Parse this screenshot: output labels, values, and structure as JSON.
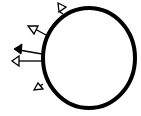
{
  "diagram": {
    "background": "#ffffff",
    "stroke": "#000000",
    "circle": {
      "cx": 89,
      "cy": 58,
      "rx": 46,
      "ry": 50,
      "stroke_width": 4
    },
    "arrows": [
      {
        "name": "arrow-top",
        "x1": 64,
        "y1": 12,
        "x2": 64,
        "y2": 12,
        "head": "open",
        "tip": [
          66,
          6
        ],
        "angle": -25
      },
      {
        "name": "arrow-upper-left",
        "x1": 45,
        "y1": 34,
        "x2": 34,
        "y2": 28,
        "head": "open"
      },
      {
        "name": "arrow-middle-filled",
        "x1": 41,
        "y1": 54,
        "x2": 20,
        "y2": 50,
        "head": "filled"
      },
      {
        "name": "arrow-middle-open",
        "x1": 41,
        "y1": 61,
        "x2": 18,
        "y2": 61,
        "head": "open"
      },
      {
        "name": "arrow-bottom-left",
        "x1": 42,
        "y1": 86,
        "x2": 42,
        "y2": 86,
        "head": "open"
      }
    ]
  }
}
